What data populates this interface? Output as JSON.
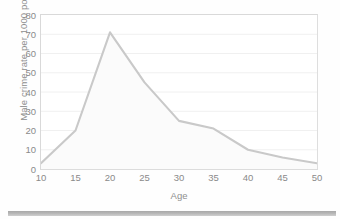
{
  "chart_data": {
    "type": "area",
    "title": "",
    "xlabel": "Age",
    "ylabel": "Male crime rate per 1000 population",
    "x": [
      10,
      15,
      20,
      25,
      30,
      35,
      40,
      45,
      50
    ],
    "values": [
      3,
      20,
      71,
      45,
      25,
      21,
      10,
      6,
      3
    ],
    "series": [
      {
        "name": "Male crime rate",
        "values": [
          3,
          20,
          71,
          45,
          25,
          21,
          10,
          6,
          3
        ]
      }
    ],
    "xlim": [
      10,
      50
    ],
    "ylim": [
      0,
      80
    ],
    "xticks": [
      "10",
      "15",
      "20",
      "25",
      "30",
      "35",
      "40",
      "45",
      "50"
    ],
    "yticks": [
      "0",
      "10",
      "20",
      "30",
      "40",
      "50",
      "60",
      "70",
      "80"
    ],
    "grid": "horizontal",
    "legend": "none",
    "line_color": "#c9c9c9",
    "fill_color": "#fbfbfb",
    "axis_color": "#d9d9d9",
    "text_color": "#8a8a8a"
  }
}
